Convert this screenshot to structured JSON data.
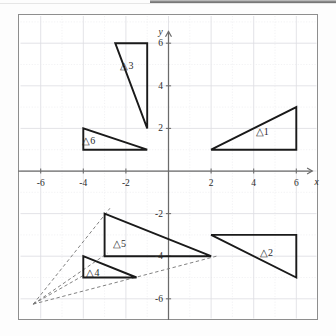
{
  "figure": {
    "type": "coordinate-plane-diagram",
    "axis": {
      "x_label": "x",
      "y_label": "y",
      "x_ticks": [
        "-6",
        "-4",
        "-2",
        "2",
        "4",
        "6"
      ],
      "x_tick_values": [
        -6,
        -4,
        -2,
        2,
        4,
        6
      ],
      "y_ticks": [
        "6",
        "4",
        "2",
        "-2",
        "-4",
        "-6"
      ],
      "y_tick_values": [
        6,
        4,
        2,
        -2,
        -4,
        -6
      ],
      "xlim": [
        -7.2,
        7.0
      ],
      "ylim": [
        -7.2,
        7.0
      ],
      "grid": true,
      "grid_step": 1
    },
    "colors": {
      "shape_stroke": "#1a1a1a",
      "axis": "#6b6b6b",
      "grid": "#e9e9ec",
      "grid_major": "#dedee3",
      "frame": "#8e8e8e",
      "dashed": "#7a7a7a",
      "text": "#2b2b2b",
      "background": "#ffffff"
    },
    "triangles": [
      {
        "name": "triangle-1",
        "label": "△1",
        "label_pos": [
          4.4,
          1.9
        ],
        "vertices": [
          [
            2,
            1
          ],
          [
            6,
            1
          ],
          [
            6,
            3
          ]
        ]
      },
      {
        "name": "triangle-2",
        "label": "△2",
        "label_pos": [
          4.6,
          -3.8
        ],
        "vertices": [
          [
            2,
            -3
          ],
          [
            6,
            -3
          ],
          [
            6,
            -5
          ]
        ]
      },
      {
        "name": "triangle-3",
        "label": "△3",
        "label_pos": [
          -1.95,
          5.0
        ],
        "vertices": [
          [
            -2.5,
            6
          ],
          [
            -1,
            6
          ],
          [
            -1,
            2
          ]
        ]
      },
      {
        "name": "triangle-4",
        "label": "△4",
        "label_pos": [
          -3.55,
          -4.75
        ],
        "vertices": [
          [
            -4,
            -4
          ],
          [
            -4,
            -5
          ],
          [
            -1.5,
            -5
          ]
        ]
      },
      {
        "name": "triangle-5",
        "label": "△5",
        "label_pos": [
          -2.3,
          -3.4
        ],
        "vertices": [
          [
            -3,
            -2
          ],
          [
            -3,
            -4
          ],
          [
            2,
            -4
          ]
        ]
      },
      {
        "name": "triangle-6",
        "label": "△6",
        "label_pos": [
          -3.75,
          1.45
        ],
        "vertices": [
          [
            -4,
            2
          ],
          [
            -4,
            1
          ],
          [
            -1,
            1
          ]
        ]
      }
    ],
    "dashed_lines": [
      {
        "name": "dash-to-tri5-top",
        "from": [
          -6.35,
          -6.25
        ],
        "to": [
          -2.75,
          -1.75
        ]
      },
      {
        "name": "dash-to-tri5-corner",
        "from": [
          -6.35,
          -6.25
        ],
        "to": [
          -2.85,
          -3.85
        ]
      },
      {
        "name": "dash-to-tri4-corner",
        "from": [
          -6.35,
          -6.25
        ],
        "to": [
          -3.9,
          -4.85
        ]
      },
      {
        "name": "dash-to-tri5-right",
        "from": [
          -6.35,
          -6.25
        ],
        "to": [
          2.25,
          -4.0
        ]
      }
    ]
  }
}
